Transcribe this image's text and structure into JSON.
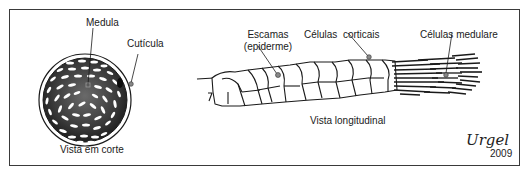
{
  "figure": {
    "cross_section": {
      "caption": "Vista em corte",
      "labels": {
        "medula": "Medula",
        "cuticula": "Cutícula"
      }
    },
    "longitudinal": {
      "caption": "Vista longitudinal",
      "labels": {
        "escamas_line1": "Escamas",
        "escamas_line2": "(epiderme)",
        "celulas_corticais": "Células  corticais",
        "celulas_medulares": "Células medulare"
      }
    },
    "signature": {
      "name": "Urgel",
      "year": "2009"
    },
    "colors": {
      "stroke": "#1a1a1a",
      "cortex_dark": "#2a2a2a",
      "marker": "#777777",
      "frame": "#3a3a3a"
    }
  }
}
